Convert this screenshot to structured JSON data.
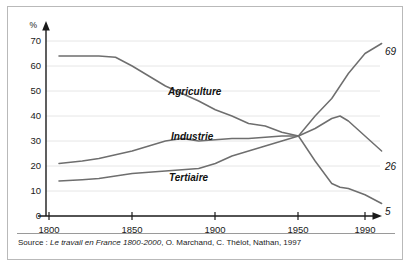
{
  "figure": {
    "source_prefix": "Source : ",
    "source_title": "Le travail en France 1800-2000",
    "source_rest": ", O. Marchand, C. Thélot, Nathan, 1997",
    "frame_color": "#b9b9b9",
    "line_color": "#6e6e6e",
    "grid_color": "#e6e6e6",
    "axis_color": "#1a1a1a"
  },
  "chart_data": {
    "type": "line",
    "title": "",
    "xlabel": "",
    "ylabel": "%",
    "xlim": [
      1800,
      2000
    ],
    "ylim": [
      0,
      75
    ],
    "yticks": [
      0,
      10,
      20,
      30,
      40,
      50,
      60,
      70
    ],
    "ytick_labels": [
      "0",
      "10",
      "20",
      "30",
      "40",
      "50",
      "60",
      "70"
    ],
    "xticks": [
      1800,
      1850,
      1900,
      1950,
      1990
    ],
    "xtick_labels": [
      "1800",
      "1850",
      "1900",
      "1950",
      "1990"
    ],
    "grid": true,
    "legend": "inline-labels",
    "x": [
      1806,
      1820,
      1830,
      1840,
      1850,
      1860,
      1870,
      1880,
      1890,
      1900,
      1910,
      1920,
      1930,
      1940,
      1950,
      1960,
      1970,
      1975,
      1980,
      1990,
      2000
    ],
    "series": [
      {
        "name": "Agriculture",
        "label": "Agriculture",
        "end_label": "5",
        "end_value": 5,
        "start_value": 64,
        "values": [
          64,
          64,
          64,
          63.5,
          60,
          56,
          52,
          49,
          46,
          42.5,
          40,
          37,
          36,
          33.5,
          32,
          22,
          13,
          11.5,
          11,
          8.5,
          5
        ]
      },
      {
        "name": "Industrie",
        "label": "Industrie",
        "end_label": "26",
        "end_value": 26,
        "start_value": 21,
        "values": [
          21,
          22,
          23,
          24.5,
          26,
          28,
          30,
          31,
          30,
          30.5,
          31,
          31,
          31.5,
          32,
          32,
          35,
          39,
          40,
          38,
          32,
          26
        ]
      },
      {
        "name": "Tertiaire",
        "label": "Tertiaire",
        "end_label": "69",
        "end_value": 69,
        "start_value": 14,
        "values": [
          14,
          14.5,
          15,
          16,
          17,
          17.5,
          18,
          18.5,
          19,
          21,
          24,
          26,
          28,
          30,
          32,
          40,
          47,
          52,
          57,
          65,
          69
        ]
      }
    ],
    "annotations": [
      {
        "text": "Agriculture",
        "kind": "series-inline-label"
      },
      {
        "text": "Industrie",
        "kind": "series-inline-label"
      },
      {
        "text": "Tertiaire",
        "kind": "series-inline-label"
      },
      {
        "text": "69",
        "kind": "endpoint-value"
      },
      {
        "text": "26",
        "kind": "endpoint-value"
      },
      {
        "text": "5",
        "kind": "endpoint-value"
      }
    ]
  }
}
